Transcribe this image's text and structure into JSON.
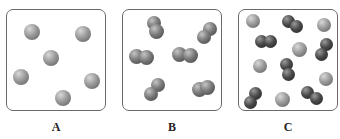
{
  "panels": [
    {
      "label": "A",
      "description": "single atoms"
    },
    {
      "label": "B",
      "description": "diatomic molecules"
    },
    {
      "label": "C",
      "description": "mixture of atoms and molecules"
    }
  ]
}
